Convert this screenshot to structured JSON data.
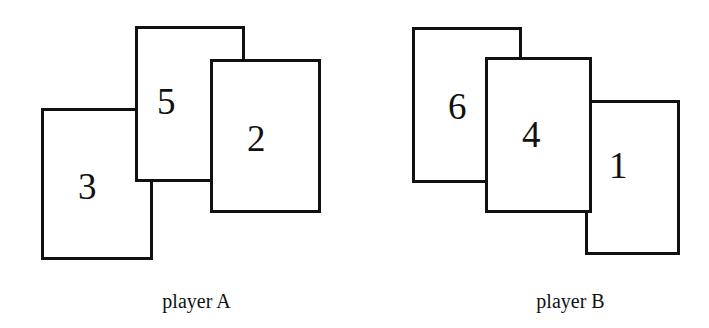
{
  "figure": {
    "width": 709,
    "height": 328,
    "background_color": "#ffffff",
    "ink_color": "#111111"
  },
  "groups": [
    {
      "id": "player-a",
      "label": "player A",
      "label_x": 134,
      "label_y": 291,
      "label_width": 125,
      "cards": [
        {
          "id": "card-a-3",
          "value": "3",
          "x": 41,
          "y": 108,
          "width": 112,
          "height": 152,
          "z": 1,
          "value_x": 78,
          "value_y": 168
        },
        {
          "id": "card-a-5",
          "value": "5",
          "x": 135,
          "y": 26,
          "width": 110,
          "height": 156,
          "z": 2,
          "value_x": 157,
          "value_y": 83
        },
        {
          "id": "card-a-2",
          "value": "2",
          "x": 210,
          "y": 59,
          "width": 111,
          "height": 154,
          "z": 3,
          "value_x": 247,
          "value_y": 120
        }
      ]
    },
    {
      "id": "player-b",
      "label": "player  B",
      "label_x": 505,
      "label_y": 291,
      "label_width": 131,
      "cards": [
        {
          "id": "card-b-6",
          "value": "6",
          "x": 412,
          "y": 27,
          "width": 110,
          "height": 156,
          "z": 1,
          "value_x": 448,
          "value_y": 88
        },
        {
          "id": "card-b-1",
          "value": "1",
          "x": 585,
          "y": 100,
          "width": 95,
          "height": 155,
          "z": 2,
          "value_x": 609,
          "value_y": 147
        },
        {
          "id": "card-b-4",
          "value": "4",
          "x": 485,
          "y": 57,
          "width": 107,
          "height": 156,
          "z": 3,
          "value_x": 522,
          "value_y": 116
        }
      ]
    }
  ]
}
